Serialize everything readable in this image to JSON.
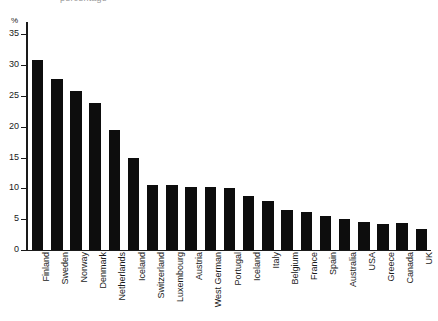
{
  "top_cut_text": "percentage",
  "chart_data": {
    "type": "bar",
    "title": "",
    "subtitle": "",
    "xlabel": "",
    "ylabel": "%",
    "ylim": [
      0,
      37
    ],
    "yticks": [
      0,
      5,
      10,
      15,
      20,
      25,
      30,
      35
    ],
    "ytick_labels": [
      "0",
      "5",
      "10",
      "15",
      "20",
      "25",
      "30",
      "35"
    ],
    "grid": false,
    "legend": null,
    "bar_color": "#0d0d0d",
    "axis_color": "#1a1a1a",
    "categories": [
      "Finland",
      "Sweden",
      "Norway",
      "Denmark",
      "Netherlands",
      "Iceland",
      "Switzerland",
      "Luxembourg",
      "Austria",
      "West German",
      "Portugal",
      "Iceland",
      "Italy",
      "Belgium",
      "France",
      "Spain",
      "Australia",
      "USA",
      "Greece",
      "Canada",
      "UK"
    ],
    "values": [
      30.8,
      27.8,
      25.8,
      23.9,
      19.5,
      15.0,
      10.6,
      10.5,
      10.3,
      10.2,
      10.0,
      8.8,
      8.0,
      6.5,
      6.2,
      5.5,
      5.0,
      4.6,
      4.2,
      4.4,
      3.4
    ]
  }
}
